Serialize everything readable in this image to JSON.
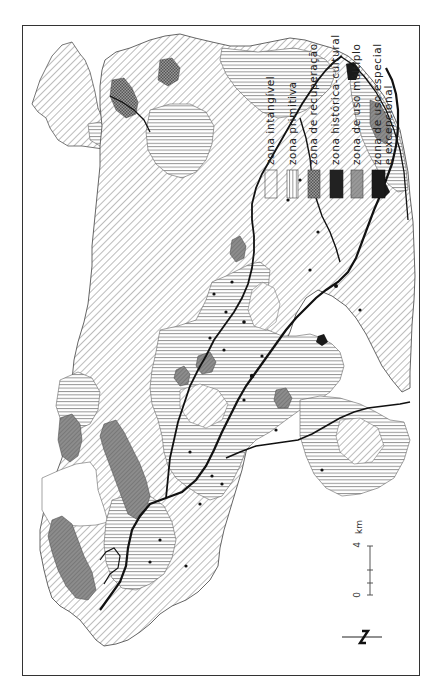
{
  "map": {
    "orientation": "rotated 90 degrees counter-clockwise",
    "colors": {
      "frame": "#333333",
      "outline": "#555555",
      "road": "#111111",
      "intangivel_hatch": "#777777",
      "primitiva_hatch": "#888888",
      "recuperacao_fill": "#8a8a8a",
      "historica_fill": "#222222",
      "uso_multiplo_fill": "#999999",
      "uso_especial_fill": "#1a1a1a"
    }
  },
  "legend": {
    "items": [
      {
        "label": "zona intangível",
        "pattern": "diagonal-hatch"
      },
      {
        "label": "zona primitiva",
        "pattern": "horizontal-lines"
      },
      {
        "label": "zona de recuperação",
        "pattern": "cross-hatch-dark"
      },
      {
        "label": "zona histórica-cultural",
        "pattern": "solid-black"
      },
      {
        "label": "zona de uso múltiplo",
        "pattern": "grey-stipple"
      },
      {
        "label": "zona de uso especial\ne excepcional",
        "pattern": "solid-black"
      }
    ]
  },
  "scale_bar": {
    "start_label": "0",
    "end_label": "4",
    "unit": "km"
  },
  "north_arrow": {
    "label": "N"
  }
}
